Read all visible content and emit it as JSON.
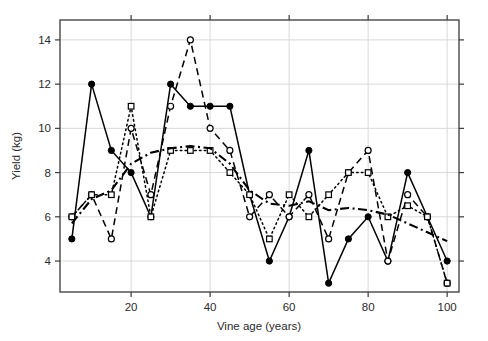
{
  "chart_data": {
    "type": "line",
    "title": "",
    "subtitle": "",
    "xlabel": "Vine age (years)",
    "ylabel": "Yield (kg)",
    "xlim": [
      2,
      103
    ],
    "ylim": [
      2.6,
      14.9
    ],
    "xticks": [
      20,
      40,
      60,
      80,
      100
    ],
    "yticks": [
      4,
      6,
      8,
      10,
      12,
      14
    ],
    "xtick_labels": [
      "20",
      "40",
      "60",
      "80",
      "100"
    ],
    "ytick_labels": [
      "4",
      "6",
      "8",
      "10",
      "12",
      "14"
    ],
    "grid": true,
    "grid_color": "#d9d9d9",
    "legend": "none",
    "frame_color": "#3a3a3a",
    "x": [
      5,
      10,
      15,
      20,
      25,
      30,
      35,
      40,
      45,
      50,
      55,
      60,
      65,
      70,
      75,
      80,
      85,
      90,
      95,
      100
    ],
    "series": [
      {
        "name": "series-solid-filled-circle",
        "marker": "filled-circle",
        "linestyle": "solid",
        "color": "#000000",
        "values": [
          5,
          12,
          9,
          8,
          6,
          12,
          11,
          11,
          11,
          7,
          4,
          6,
          9,
          3,
          5,
          6,
          4,
          8,
          6,
          4
        ]
      },
      {
        "name": "series-dashed-open-circle",
        "marker": "open-circle",
        "linestyle": "dashed",
        "color": "#000000",
        "values": [
          6,
          7,
          5,
          10,
          7,
          11,
          14,
          10,
          9,
          6,
          7,
          6,
          7,
          5,
          8,
          9,
          4,
          7,
          6,
          3
        ]
      },
      {
        "name": "series-dotted-open-square",
        "marker": "open-square",
        "linestyle": "dotted",
        "color": "#000000",
        "values": [
          6,
          7,
          7,
          11,
          6,
          9,
          9,
          9,
          8,
          7,
          5,
          7,
          6,
          7,
          8,
          8,
          6,
          6.5,
          6,
          3
        ]
      },
      {
        "name": "series-dashdot-mean",
        "marker": "none",
        "linestyle": "dashdot",
        "color": "#000000",
        "values": [
          5.7,
          6.8,
          7.2,
          8.4,
          8.9,
          9.1,
          9.2,
          9.1,
          8.4,
          7.2,
          6.6,
          6.5,
          6.7,
          6.3,
          6.4,
          6.3,
          6.1,
          5.7,
          5.3,
          4.9
        ]
      }
    ]
  },
  "axes": {
    "y_axis_title": "Yield (kg)",
    "x_axis_title": "Vine age (years)"
  }
}
